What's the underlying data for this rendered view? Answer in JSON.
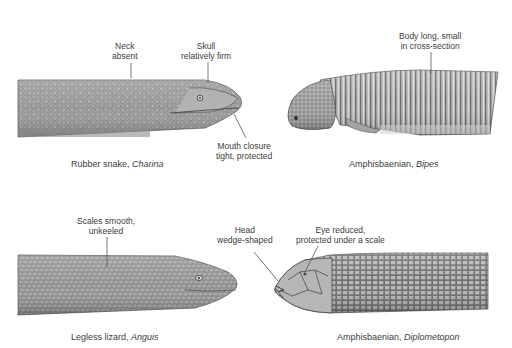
{
  "figure": {
    "panels": [
      {
        "id": "charina",
        "caption_common": "Rubber snake, ",
        "caption_genus": "Charina",
        "callouts": [
          {
            "id": "neck",
            "line1": "Neck",
            "line2": "absent"
          },
          {
            "id": "skull",
            "line1": "Skull",
            "line2": "relatively firm"
          },
          {
            "id": "mouth",
            "line1": "Mouth closure",
            "line2": "tight, protected"
          }
        ]
      },
      {
        "id": "bipes",
        "caption_common": "Amphisbaenian, ",
        "caption_genus": "Bipes",
        "callouts": [
          {
            "id": "body",
            "line1": "Body long, small",
            "line2": "in cross-section"
          }
        ]
      },
      {
        "id": "anguis",
        "caption_common": "Legless lizard, ",
        "caption_genus": "Anguis",
        "callouts": [
          {
            "id": "scales",
            "line1": "Scales smooth,",
            "line2": "unkeeled"
          }
        ]
      },
      {
        "id": "diplometopon",
        "caption_common": "Amphisbaenian, ",
        "caption_genus": "Diplometopon",
        "callouts": [
          {
            "id": "head",
            "line1": "Head",
            "line2": "wedge-shaped"
          },
          {
            "id": "eye",
            "line1": "Eye reduced,",
            "line2": "protected under a scale"
          }
        ]
      }
    ],
    "colors": {
      "background": "#ffffff",
      "body_fill": "#9a9a9a",
      "body_dark": "#5e5e5e",
      "body_light": "#c9c9c9",
      "scale_line": "#4a4a4a",
      "leader_line": "#555555",
      "text": "#3c3c3c"
    }
  }
}
